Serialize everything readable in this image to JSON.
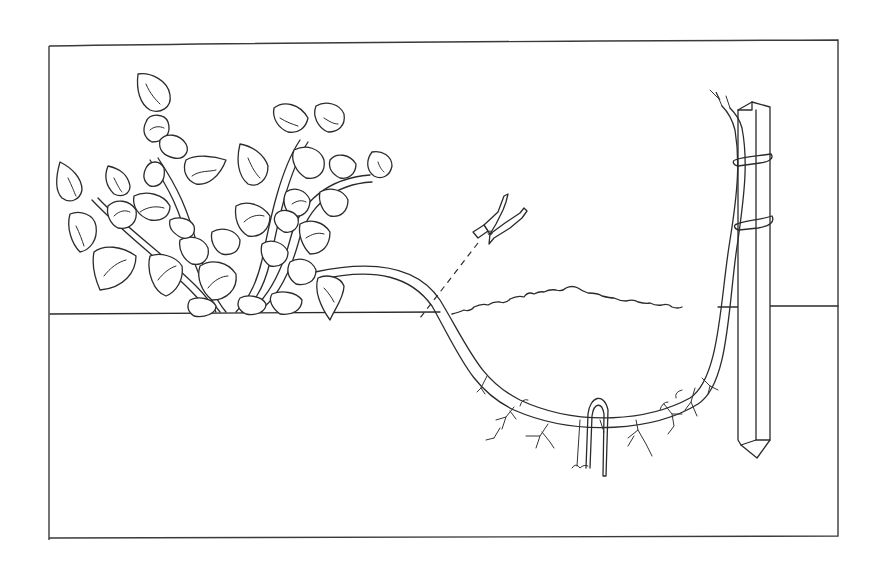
{
  "figure": {
    "title": "Serpentine layering of a vining plant",
    "colors": {
      "ink": "#2b2b2b",
      "paper": "#ffffff"
    },
    "frame": {
      "x": 49,
      "y": 40,
      "width": 789,
      "height": 497
    },
    "elements": {
      "parent_plant": "vining-plant-with-heart-shaped-leaves",
      "layered_stem": "stem-bent-into-soil",
      "pruning_clip": "clip-icon",
      "soil_pin": "u-shaped-wire-pin",
      "support_stake": "wooden-stake",
      "tie": "stem-tied-to-stake",
      "soil_mound": "mounded-soil-line",
      "roots": "adventitious-roots-on-buried-stem",
      "ground_line": "soil-surface"
    }
  }
}
